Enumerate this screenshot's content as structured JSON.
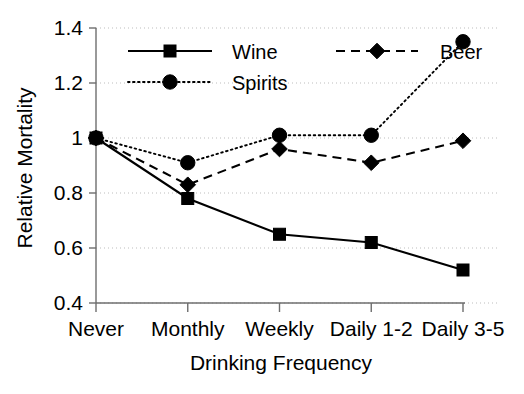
{
  "chart_data": {
    "type": "line",
    "title": "",
    "xlabel": "Drinking Frequency",
    "ylabel": "Relative Mortality",
    "categories": [
      "Never",
      "Monthly",
      "Weekly",
      "Daily 1-2",
      "Daily 3-5"
    ],
    "ylim": [
      0.4,
      1.4
    ],
    "yticks": [
      "0.4",
      "0.6",
      "0.8",
      "1",
      "1.2",
      "1.4"
    ],
    "ytick_values": [
      0.4,
      0.6,
      0.8,
      1.0,
      1.2,
      1.4
    ],
    "grid": true,
    "grid_axis": "y",
    "legend_position": "top-center",
    "series": [
      {
        "name": "Wine",
        "values": [
          1.0,
          0.78,
          0.65,
          0.62,
          0.52
        ],
        "line_style": "solid",
        "marker": "square",
        "color": "#000000"
      },
      {
        "name": "Spirits",
        "values": [
          1.0,
          0.91,
          1.01,
          1.01,
          1.35
        ],
        "line_style": "dotted",
        "marker": "circle",
        "color": "#000000"
      },
      {
        "name": "Beer",
        "values": [
          1.0,
          0.83,
          0.96,
          0.91,
          0.99
        ],
        "line_style": "dashed",
        "marker": "diamond",
        "color": "#000000"
      }
    ]
  },
  "legend": {
    "entries": [
      {
        "label": "Wine"
      },
      {
        "label": "Spirits"
      },
      {
        "label": "Beer"
      }
    ]
  }
}
